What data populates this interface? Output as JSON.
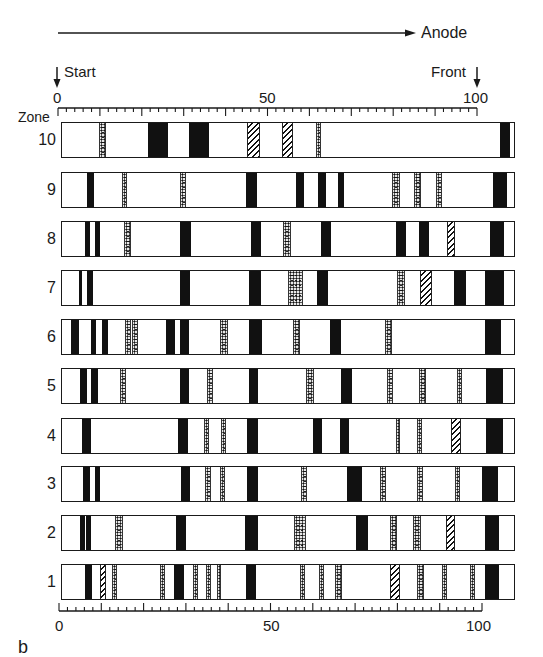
{
  "figure": {
    "direction_label": "Anode",
    "start_label": "Start",
    "front_label": "Front",
    "zone_header": "Zone",
    "panel_label": "b"
  },
  "scales": {
    "top": {
      "ticks": [
        "0",
        "50",
        "100"
      ]
    },
    "bottom": {
      "ticks": [
        "0",
        "50",
        "100"
      ]
    }
  },
  "legend_types": {
    "solid": "black band",
    "dotted": "stippled band",
    "hatched": "hatched band"
  },
  "chart_data": {
    "type": "electrophoresis-zymogram",
    "title": "",
    "xlabel": "Relative migration (Start 0 → Front 100), toward Anode",
    "ylabel": "Zone",
    "x_range": [
      0,
      100
    ],
    "zones": [
      {
        "zone": "10",
        "bands": [
          {
            "pos": 10,
            "type": "dotted"
          },
          {
            "pos": 22,
            "type": "solid"
          },
          {
            "pos": 31,
            "type": "solid"
          },
          {
            "pos": 45,
            "type": "hatched"
          },
          {
            "pos": 53,
            "type": "hatched"
          },
          {
            "pos": 61,
            "type": "dotted"
          },
          {
            "pos": 105,
            "type": "solid"
          }
        ]
      },
      {
        "zone": "9",
        "bands": [
          {
            "pos": 6,
            "type": "solid"
          },
          {
            "pos": 15,
            "type": "dotted"
          },
          {
            "pos": 29,
            "type": "dotted"
          },
          {
            "pos": 45,
            "type": "solid"
          },
          {
            "pos": 57,
            "type": "solid"
          },
          {
            "pos": 62,
            "type": "solid"
          },
          {
            "pos": 67,
            "type": "solid"
          },
          {
            "pos": 80,
            "type": "dotted"
          },
          {
            "pos": 85,
            "type": "dotted"
          },
          {
            "pos": 90,
            "type": "dotted"
          },
          {
            "pos": 104,
            "type": "solid"
          }
        ]
      },
      {
        "zone": "8",
        "bands": [
          {
            "pos": 6,
            "type": "solid"
          },
          {
            "pos": 8,
            "type": "solid"
          },
          {
            "pos": 16,
            "type": "dotted"
          },
          {
            "pos": 29,
            "type": "solid"
          },
          {
            "pos": 46,
            "type": "solid"
          },
          {
            "pos": 53,
            "type": "dotted"
          },
          {
            "pos": 63,
            "type": "solid"
          },
          {
            "pos": 81,
            "type": "solid"
          },
          {
            "pos": 87,
            "type": "solid"
          },
          {
            "pos": 93,
            "type": "hatched"
          },
          {
            "pos": 104,
            "type": "solid"
          }
        ]
      },
      {
        "zone": "7",
        "bands": [
          {
            "pos": 5,
            "type": "solid"
          },
          {
            "pos": 7,
            "type": "solid"
          },
          {
            "pos": 29,
            "type": "solid"
          },
          {
            "pos": 45,
            "type": "solid"
          },
          {
            "pos": 56,
            "type": "dotted"
          },
          {
            "pos": 61,
            "type": "solid"
          },
          {
            "pos": 80,
            "type": "dotted"
          },
          {
            "pos": 85,
            "type": "hatched"
          },
          {
            "pos": 93,
            "type": "solid"
          },
          {
            "pos": 101,
            "type": "solid"
          }
        ]
      },
      {
        "zone": "6",
        "bands": [
          {
            "pos": 3,
            "type": "solid"
          },
          {
            "pos": 8,
            "type": "solid"
          },
          {
            "pos": 11,
            "type": "solid"
          },
          {
            "pos": 16,
            "type": "dotted"
          },
          {
            "pos": 18,
            "type": "dotted"
          },
          {
            "pos": 26,
            "type": "solid"
          },
          {
            "pos": 29,
            "type": "solid"
          },
          {
            "pos": 39,
            "type": "dotted"
          },
          {
            "pos": 46,
            "type": "solid"
          },
          {
            "pos": 56,
            "type": "dotted"
          },
          {
            "pos": 65,
            "type": "dotted"
          },
          {
            "pos": 70,
            "type": "solid"
          },
          {
            "pos": 77,
            "type": "dotted"
          },
          {
            "pos": 101,
            "type": "solid"
          }
        ]
      },
      {
        "zone": "5",
        "bands": [
          {
            "pos": 5,
            "type": "solid"
          },
          {
            "pos": 8,
            "type": "solid"
          },
          {
            "pos": 15,
            "type": "dotted"
          },
          {
            "pos": 29,
            "type": "solid"
          },
          {
            "pos": 35,
            "type": "dotted"
          },
          {
            "pos": 46,
            "type": "solid"
          },
          {
            "pos": 57,
            "type": "dotted"
          },
          {
            "pos": 67,
            "type": "solid"
          },
          {
            "pos": 78,
            "type": "dotted"
          },
          {
            "pos": 87,
            "type": "dotted"
          },
          {
            "pos": 95,
            "type": "dotted"
          },
          {
            "pos": 101,
            "type": "solid"
          }
        ]
      },
      {
        "zone": "4",
        "bands": [
          {
            "pos": 5,
            "type": "solid"
          },
          {
            "pos": 29,
            "type": "solid"
          },
          {
            "pos": 34,
            "type": "dotted"
          },
          {
            "pos": 38,
            "type": "dotted"
          },
          {
            "pos": 46,
            "type": "solid"
          },
          {
            "pos": 62,
            "type": "solid"
          },
          {
            "pos": 68,
            "type": "solid"
          },
          {
            "pos": 79,
            "type": "dotted"
          },
          {
            "pos": 84,
            "type": "dotted"
          },
          {
            "pos": 93,
            "type": "hatched"
          },
          {
            "pos": 101,
            "type": "solid"
          }
        ]
      },
      {
        "zone": "3",
        "bands": [
          {
            "pos": 5,
            "type": "solid"
          },
          {
            "pos": 7,
            "type": "solid"
          },
          {
            "pos": 29,
            "type": "solid"
          },
          {
            "pos": 34,
            "type": "dotted"
          },
          {
            "pos": 38,
            "type": "dotted"
          },
          {
            "pos": 46,
            "type": "solid"
          },
          {
            "pos": 57,
            "type": "dotted"
          },
          {
            "pos": 68,
            "type": "solid"
          },
          {
            "pos": 76,
            "type": "dotted"
          },
          {
            "pos": 85,
            "type": "dotted"
          },
          {
            "pos": 94,
            "type": "dotted"
          },
          {
            "pos": 101,
            "type": "solid"
          }
        ]
      },
      {
        "zone": "2",
        "bands": [
          {
            "pos": 5,
            "type": "solid"
          },
          {
            "pos": 6,
            "type": "solid"
          },
          {
            "pos": 14,
            "type": "dotted"
          },
          {
            "pos": 28,
            "type": "solid"
          },
          {
            "pos": 45,
            "type": "solid"
          },
          {
            "pos": 57,
            "type": "dotted"
          },
          {
            "pos": 71,
            "type": "solid"
          },
          {
            "pos": 79,
            "type": "dotted"
          },
          {
            "pos": 84,
            "type": "dotted"
          },
          {
            "pos": 91,
            "type": "hatched"
          },
          {
            "pos": 100,
            "type": "solid"
          }
        ]
      },
      {
        "zone": "1",
        "bands": [
          {
            "pos": 7,
            "type": "solid"
          },
          {
            "pos": 10,
            "type": "hatched"
          },
          {
            "pos": 13,
            "type": "dotted"
          },
          {
            "pos": 24,
            "type": "dotted"
          },
          {
            "pos": 28,
            "type": "solid"
          },
          {
            "pos": 32,
            "type": "dotted"
          },
          {
            "pos": 35,
            "type": "dotted"
          },
          {
            "pos": 37,
            "type": "dotted"
          },
          {
            "pos": 46,
            "type": "solid"
          },
          {
            "pos": 57,
            "type": "dotted"
          },
          {
            "pos": 61,
            "type": "dotted"
          },
          {
            "pos": 64,
            "type": "dotted"
          },
          {
            "pos": 77,
            "type": "hatched"
          },
          {
            "pos": 83,
            "type": "dotted"
          },
          {
            "pos": 89,
            "type": "dotted"
          },
          {
            "pos": 95,
            "type": "dotted"
          },
          {
            "pos": 100,
            "type": "solid"
          }
        ]
      }
    ]
  },
  "rows_px": [
    {
      "zone": "10",
      "top": 122,
      "bands": [
        [
          99,
          106,
          "dotted"
        ],
        [
          148,
          168,
          "solid"
        ],
        [
          189,
          209,
          "solid"
        ],
        [
          247,
          260,
          "hatched"
        ],
        [
          282,
          293,
          "hatched"
        ],
        [
          316,
          321,
          "dotted"
        ],
        [
          500,
          510,
          "solid"
        ]
      ]
    },
    {
      "zone": "9",
      "top": 172,
      "bands": [
        [
          87,
          94,
          "solid"
        ],
        [
          122,
          127,
          "dotted"
        ],
        [
          180,
          186,
          "dotted"
        ],
        [
          246,
          257,
          "solid"
        ],
        [
          296,
          304,
          "solid"
        ],
        [
          318,
          326,
          "solid"
        ],
        [
          338,
          344,
          "solid"
        ],
        [
          392,
          400,
          "dotted"
        ],
        [
          414,
          421,
          "dotted"
        ],
        [
          436,
          442,
          "dotted"
        ],
        [
          493,
          507,
          "solid"
        ]
      ]
    },
    {
      "zone": "8",
      "top": 221,
      "bands": [
        [
          85,
          90,
          "solid"
        ],
        [
          95,
          100,
          "solid"
        ],
        [
          124,
          131,
          "dotted"
        ],
        [
          180,
          191,
          "solid"
        ],
        [
          251,
          261,
          "solid"
        ],
        [
          283,
          291,
          "dotted"
        ],
        [
          321,
          331,
          "solid"
        ],
        [
          396,
          406,
          "solid"
        ],
        [
          419,
          429,
          "solid"
        ],
        [
          447,
          455,
          "hatched"
        ],
        [
          490,
          504,
          "solid"
        ]
      ]
    },
    {
      "zone": "7",
      "top": 270,
      "bands": [
        [
          79,
          82,
          "solid"
        ],
        [
          87,
          93,
          "solid"
        ],
        [
          180,
          190,
          "solid"
        ],
        [
          249,
          261,
          "solid"
        ],
        [
          288,
          303,
          "dotted"
        ],
        [
          317,
          328,
          "solid"
        ],
        [
          397,
          405,
          "dotted"
        ],
        [
          420,
          432,
          "hatched"
        ],
        [
          454,
          466,
          "solid"
        ],
        [
          485,
          504,
          "solid"
        ]
      ]
    },
    {
      "zone": "6",
      "top": 319,
      "bands": [
        [
          71,
          79,
          "solid"
        ],
        [
          91,
          96,
          "solid"
        ],
        [
          102,
          108,
          "solid"
        ],
        [
          125,
          131,
          "dotted"
        ],
        [
          132,
          138,
          "dotted"
        ],
        [
          166,
          175,
          "solid"
        ],
        [
          180,
          189,
          "solid"
        ],
        [
          220,
          228,
          "dotted"
        ],
        [
          249,
          262,
          "solid"
        ],
        [
          293,
          300,
          "dotted"
        ],
        [
          330,
          341,
          "solid"
        ],
        [
          385,
          392,
          "dotted"
        ],
        [
          485,
          501,
          "solid"
        ]
      ]
    },
    {
      "zone": "5",
      "top": 368,
      "bands": [
        [
          80,
          87,
          "solid"
        ],
        [
          91,
          98,
          "solid"
        ],
        [
          120,
          126,
          "dotted"
        ],
        [
          180,
          189,
          "solid"
        ],
        [
          207,
          213,
          "dotted"
        ],
        [
          249,
          258,
          "solid"
        ],
        [
          306,
          314,
          "dotted"
        ],
        [
          341,
          352,
          "solid"
        ],
        [
          387,
          393,
          "dotted"
        ],
        [
          419,
          426,
          "dotted"
        ],
        [
          457,
          462,
          "dotted"
        ],
        [
          486,
          503,
          "solid"
        ]
      ]
    },
    {
      "zone": "4",
      "top": 418,
      "bands": [
        [
          82,
          91,
          "solid"
        ],
        [
          178,
          188,
          "solid"
        ],
        [
          204,
          209,
          "dotted"
        ],
        [
          221,
          226,
          "dotted"
        ],
        [
          247,
          258,
          "solid"
        ],
        [
          313,
          322,
          "solid"
        ],
        [
          340,
          349,
          "solid"
        ],
        [
          396,
          400,
          "dotted"
        ],
        [
          417,
          422,
          "dotted"
        ],
        [
          451,
          461,
          "hatched"
        ],
        [
          486,
          503,
          "solid"
        ]
      ]
    },
    {
      "zone": "3",
      "top": 466,
      "bands": [
        [
          83,
          90,
          "solid"
        ],
        [
          95,
          100,
          "solid"
        ],
        [
          181,
          190,
          "solid"
        ],
        [
          205,
          211,
          "dotted"
        ],
        [
          220,
          225,
          "dotted"
        ],
        [
          247,
          258,
          "solid"
        ],
        [
          301,
          307,
          "dotted"
        ],
        [
          347,
          362,
          "solid"
        ],
        [
          380,
          386,
          "dotted"
        ],
        [
          417,
          423,
          "dotted"
        ],
        [
          455,
          460,
          "dotted"
        ],
        [
          482,
          498,
          "solid"
        ]
      ]
    },
    {
      "zone": "2",
      "top": 515,
      "bands": [
        [
          80,
          85,
          "solid"
        ],
        [
          86,
          91,
          "solid"
        ],
        [
          115,
          123,
          "dotted"
        ],
        [
          176,
          186,
          "solid"
        ],
        [
          245,
          258,
          "solid"
        ],
        [
          294,
          306,
          "dotted"
        ],
        [
          356,
          368,
          "solid"
        ],
        [
          390,
          397,
          "dotted"
        ],
        [
          413,
          421,
          "dotted"
        ],
        [
          446,
          455,
          "hatched"
        ],
        [
          485,
          499,
          "solid"
        ]
      ]
    },
    {
      "zone": "1",
      "top": 564,
      "bands": [
        [
          85,
          92,
          "solid"
        ],
        [
          100,
          106,
          "hatched"
        ],
        [
          112,
          117,
          "dotted"
        ],
        [
          160,
          165,
          "dotted"
        ],
        [
          174,
          184,
          "solid"
        ],
        [
          193,
          198,
          "dotted"
        ],
        [
          206,
          211,
          "dotted"
        ],
        [
          217,
          221,
          "dotted"
        ],
        [
          246,
          256,
          "solid"
        ],
        [
          300,
          305,
          "dotted"
        ],
        [
          319,
          324,
          "dotted"
        ],
        [
          335,
          342,
          "dotted"
        ],
        [
          390,
          400,
          "hatched"
        ],
        [
          417,
          424,
          "dotted"
        ],
        [
          442,
          447,
          "dotted"
        ],
        [
          470,
          475,
          "dotted"
        ],
        [
          485,
          499,
          "solid"
        ]
      ]
    }
  ]
}
